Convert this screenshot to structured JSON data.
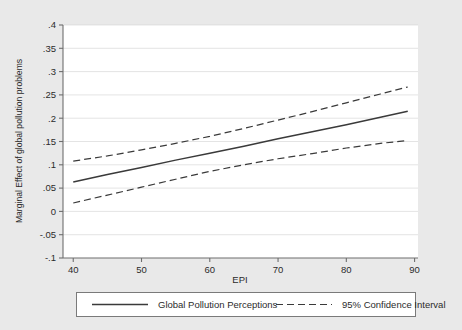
{
  "chart_data": {
    "type": "line",
    "title": "",
    "xlabel": "EPI",
    "ylabel": "Marginal Effect of global pollution problems",
    "xlim": [
      38.5,
      90.5
    ],
    "ylim": [
      -0.1,
      0.4
    ],
    "xticks": [
      40,
      50,
      60,
      70,
      80,
      90
    ],
    "xtick_labels": [
      "40",
      "50",
      "60",
      "70",
      "80",
      "90"
    ],
    "yticks": [
      -0.1,
      -0.05,
      0,
      0.05,
      0.1,
      0.15,
      0.2,
      0.25,
      0.3,
      0.35,
      0.4
    ],
    "ytick_labels": [
      "-.1",
      "-.05",
      "0",
      ".05",
      ".1",
      ".15",
      ".2",
      ".25",
      ".3",
      ".35",
      ".4"
    ],
    "grid": "horizontal",
    "legend_position": "below",
    "x": [
      40,
      45,
      50,
      55,
      60,
      65,
      70,
      75,
      80,
      85,
      89
    ],
    "series": [
      {
        "name": "Global Pollution Perceptions",
        "style": "solid",
        "values": [
          0.063,
          0.079,
          0.094,
          0.11,
          0.125,
          0.14,
          0.156,
          0.171,
          0.186,
          0.202,
          0.215
        ]
      },
      {
        "name": "95% Confidence Interval Upper",
        "style": "dashed",
        "values": [
          0.108,
          0.119,
          0.132,
          0.146,
          0.161,
          0.178,
          0.196,
          0.214,
          0.233,
          0.252,
          0.267
        ]
      },
      {
        "name": "95% Confidence Interval Lower",
        "style": "dashed",
        "values": [
          0.018,
          0.035,
          0.052,
          0.069,
          0.086,
          0.1,
          0.113,
          0.124,
          0.136,
          0.146,
          0.152
        ]
      }
    ],
    "legend": [
      {
        "label": "Global Pollution Perceptions",
        "style": "solid"
      },
      {
        "label": "95% Confidence Interval",
        "style": "dashed"
      }
    ],
    "colors": {
      "background": "#e9e9e9",
      "plot_background": "#ffffff",
      "line": "#3a3a3a",
      "grid": "#d9d9d9",
      "axis": "#6e6e6e"
    }
  }
}
